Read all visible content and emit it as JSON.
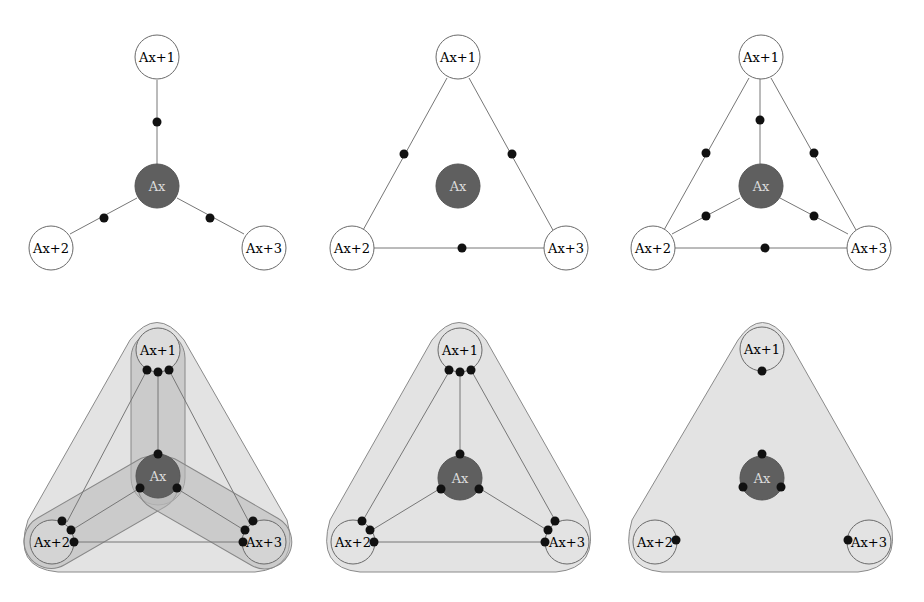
{
  "nodes": {
    "center": "Ax",
    "n1": "Ax+1",
    "n2": "Ax+2",
    "n3": "Ax+3"
  },
  "colors": {
    "center_fill": "#5f5f5f",
    "region_fill": "#e3e3e3",
    "band_fill": "#bdbdbd",
    "edge": "#777777",
    "dot": "#111111"
  },
  "panels": [
    {
      "id": "top-left",
      "description": "star: center connected to 3 outer nodes, one dot per edge"
    },
    {
      "id": "top-middle",
      "description": "triangle of outer nodes, one dot per edge, center isolated"
    },
    {
      "id": "top-right",
      "description": "complete graph K4 with one dot per edge"
    },
    {
      "id": "bottom-left",
      "description": "K4 with overlapping shaded bands and dots at endpoints"
    },
    {
      "id": "bottom-middle",
      "description": "K4 inside single shaded rounded triangle, dots at endpoints"
    },
    {
      "id": "bottom-right",
      "description": "shaded rounded triangle, one dot per node"
    }
  ]
}
